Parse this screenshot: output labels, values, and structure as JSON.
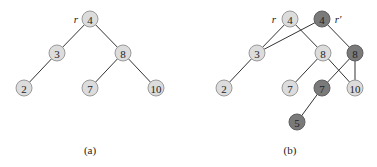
{
  "colors": {
    "light_node_fill": "#dcdcdc",
    "dark_node_fill": "#7a7a7a",
    "edge": "#333333",
    "text": "#222222"
  },
  "diagrams": [
    {
      "caption": "(a)",
      "root_labels": [
        {
          "text": "r",
          "x": 76,
          "y": 19
        }
      ],
      "nodes": [
        {
          "id": "a4",
          "key": "4",
          "x": 90,
          "y": 19,
          "style": "light"
        },
        {
          "id": "a3",
          "key": "3",
          "x": 57,
          "y": 53,
          "style": "light"
        },
        {
          "id": "a8",
          "key": "8",
          "x": 123,
          "y": 53,
          "style": "light"
        },
        {
          "id": "a2",
          "key": "2",
          "x": 24,
          "y": 88,
          "style": "light"
        },
        {
          "id": "a7",
          "key": "7",
          "x": 90,
          "y": 88,
          "style": "light"
        },
        {
          "id": "a10",
          "key": "10",
          "x": 156,
          "y": 88,
          "style": "light"
        }
      ],
      "edges": [
        [
          "a4",
          "a3"
        ],
        [
          "a4",
          "a8"
        ],
        [
          "a3",
          "a2"
        ],
        [
          "a8",
          "a7"
        ],
        [
          "a8",
          "a10"
        ]
      ],
      "caption_pos": {
        "x": 90,
        "y": 150
      }
    },
    {
      "caption": "(b)",
      "root_labels": [
        {
          "text": "r",
          "x": 274,
          "y": 19
        },
        {
          "text": "r′",
          "x": 338,
          "y": 19
        }
      ],
      "nodes": [
        {
          "id": "b4",
          "key": "4",
          "x": 290,
          "y": 19,
          "style": "light"
        },
        {
          "id": "b4p",
          "key": "4",
          "x": 322,
          "y": 19,
          "style": "dark"
        },
        {
          "id": "b3",
          "key": "3",
          "x": 257,
          "y": 53,
          "style": "light"
        },
        {
          "id": "b8",
          "key": "8",
          "x": 323,
          "y": 53,
          "style": "light"
        },
        {
          "id": "b8p",
          "key": "8",
          "x": 355,
          "y": 53,
          "style": "dark"
        },
        {
          "id": "b2",
          "key": "2",
          "x": 224,
          "y": 88,
          "style": "light"
        },
        {
          "id": "b7",
          "key": "7",
          "x": 290,
          "y": 88,
          "style": "light"
        },
        {
          "id": "b7p",
          "key": "7",
          "x": 322,
          "y": 88,
          "style": "dark"
        },
        {
          "id": "b10",
          "key": "10",
          "x": 355,
          "y": 88,
          "style": "light"
        },
        {
          "id": "b5",
          "key": "5",
          "x": 297,
          "y": 122,
          "style": "dark"
        }
      ],
      "edges": [
        [
          "b4",
          "b3"
        ],
        [
          "b4",
          "b8"
        ],
        [
          "b3",
          "b2"
        ],
        [
          "b8",
          "b7"
        ],
        [
          "b8",
          "b10"
        ],
        [
          "b4p",
          "b3"
        ],
        [
          "b4p",
          "b8p"
        ],
        [
          "b8p",
          "b7p"
        ],
        [
          "b8p",
          "b10"
        ],
        [
          "b7p",
          "b5"
        ]
      ],
      "caption_pos": {
        "x": 290,
        "y": 150
      }
    }
  ]
}
